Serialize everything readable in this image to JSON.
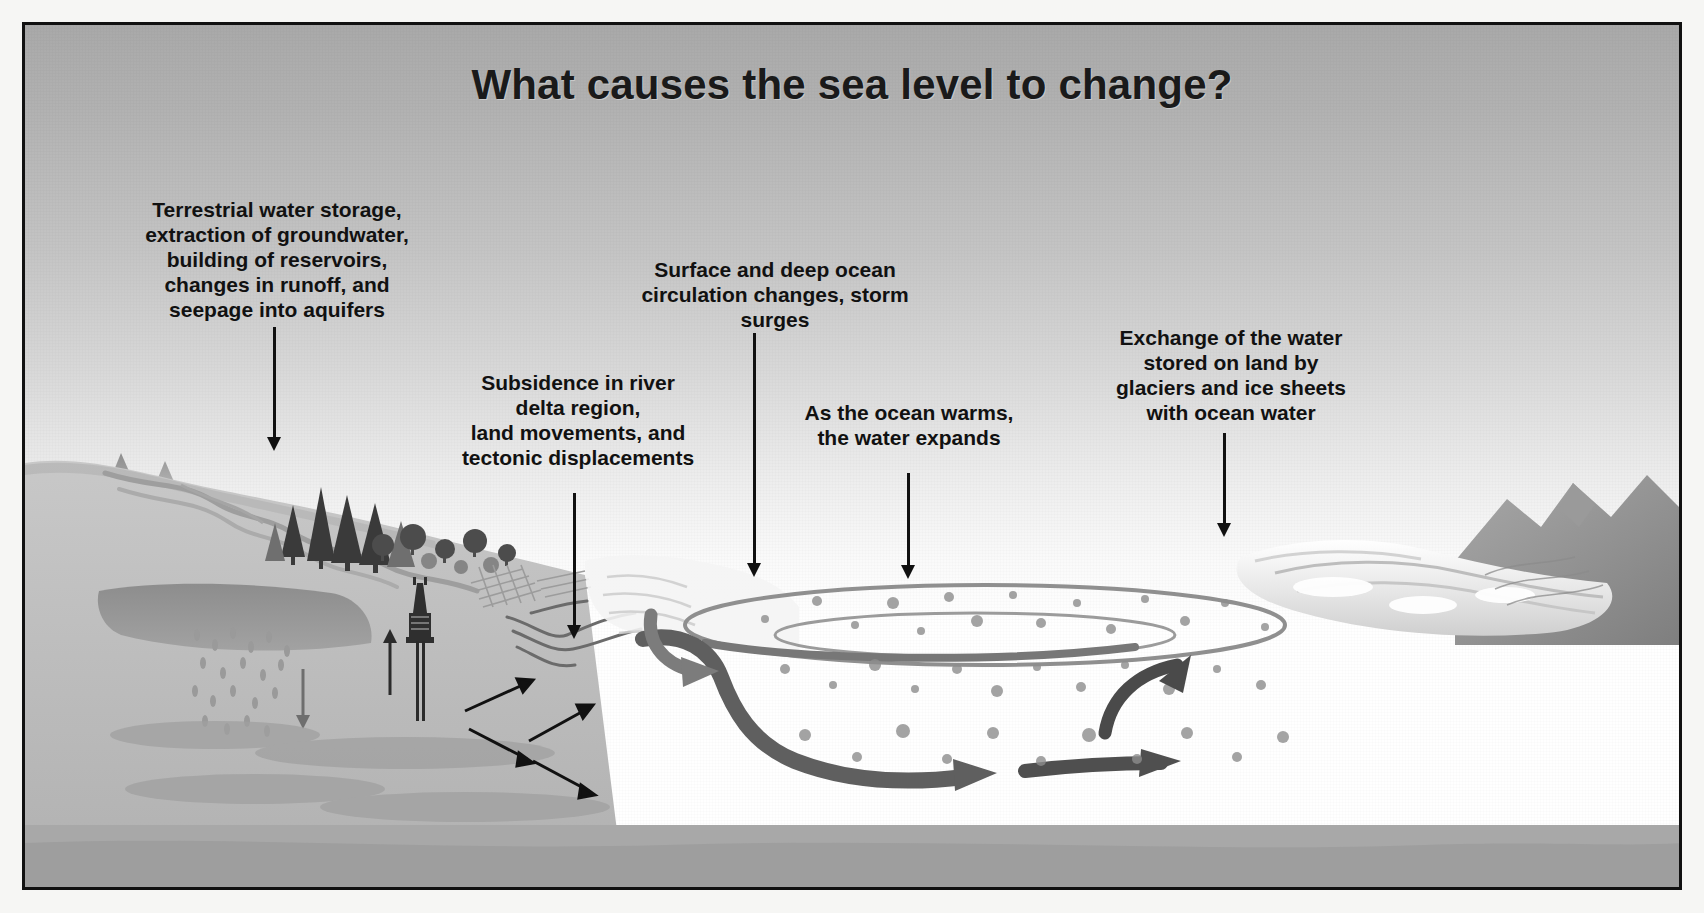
{
  "figure": {
    "title": "What causes the sea level to change?",
    "type": "cross-section schematic",
    "palette": {
      "ink": "#111111",
      "sky_top": "#a9a9a9",
      "sky_bottom": "#ffffff",
      "ocean_surface_layer": "#c9c9c9",
      "ocean_deep_layer": "#adadad",
      "land": "#bdbdbd",
      "ice": "#f2f2f2",
      "border": "#111111",
      "page": "#f6f6f4"
    }
  },
  "labels": [
    {
      "id": "terrestrial-water-storage",
      "text": "Terrestrial water storage,\nextraction of groundwater,\nbuilding of reservoirs,\nchanges in runoff, and\nseepage into aquifers",
      "points_to": "land hydrology / reservoir and aquifer region"
    },
    {
      "id": "subsidence-delta",
      "text": "Subsidence in river\ndelta region,\nland movements, and\ntectonic displacements",
      "points_to": "river delta and fault zone"
    },
    {
      "id": "ocean-circulation",
      "text": "Surface and deep ocean\ncirculation changes, storm surges",
      "points_to": "ocean surface circulation"
    },
    {
      "id": "thermal-expansion",
      "text": "As the ocean warms,\nthe water expands",
      "points_to": "ocean water column"
    },
    {
      "id": "glaciers-ice-sheets",
      "text": "Exchange of the water\nstored on land by\nglaciers and ice sheets\nwith ocean water",
      "points_to": "ice sheet / glacier margin"
    }
  ],
  "scene_elements": [
    {
      "name": "mountain-range",
      "description": "snow-topped mountain peaks at far left"
    },
    {
      "name": "river",
      "description": "river channel flowing from mountains toward reservoir"
    },
    {
      "name": "reservoir",
      "description": "dark impounded water body behind land"
    },
    {
      "name": "forest",
      "description": "coniferous and broadleaf trees on hillslope"
    },
    {
      "name": "drilling-rig",
      "description": "groundwater extraction rig with well shaft and up arrow"
    },
    {
      "name": "groundwater-seepage",
      "description": "droplet field with downward arrow into aquifer"
    },
    {
      "name": "cropland",
      "description": "hatched agricultural field pattern"
    },
    {
      "name": "river-delta",
      "description": "branching distributary channels entering the sea"
    },
    {
      "name": "fault-arrows",
      "description": "paired opposing slip arrows indicating tectonic displacement"
    },
    {
      "name": "ocean-surface-gyre",
      "description": "elliptical surface circulation loop"
    },
    {
      "name": "deep-circulation-arrow",
      "description": "dark band arrow descending and flowing along the seabed"
    },
    {
      "name": "expansion-bubbles",
      "description": "scattered bubbles representing thermal expansion of water"
    },
    {
      "name": "ice-sheet",
      "description": "glacier and ice sheet on right coastline"
    },
    {
      "name": "return-flow-arrow",
      "description": "upward curving arrow near the ice margin"
    }
  ]
}
